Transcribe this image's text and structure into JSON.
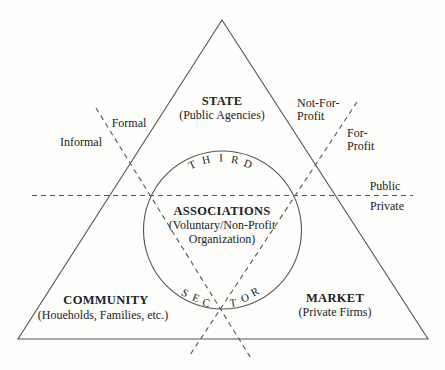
{
  "regions": {
    "state": {
      "label": "STATE",
      "sublabel": "(Public Agencies)"
    },
    "community": {
      "label": "COMMUNITY",
      "sublabel": "(Houeholds, Families, etc.)"
    },
    "market": {
      "label": "MARKET",
      "sublabel": "(Private Firms)"
    },
    "associations": {
      "label": "ASSOCIATIONS",
      "sublabel_line1": "(Voluntary/Non-Profit",
      "sublabel_line2": "Organization)"
    }
  },
  "dividers": {
    "formal": "Formal",
    "informal": "Informal",
    "not_for_profit_line1": "Not-For-",
    "not_for_profit_line2": "Profit",
    "for_profit_line1": "For-",
    "for_profit_line2": "Profit",
    "public": "Public",
    "private": "Private"
  },
  "circle_text": {
    "third": [
      "T",
      "H",
      "I",
      "R",
      "D"
    ],
    "sector": [
      "S",
      "E",
      "C",
      "T",
      "O",
      "R"
    ]
  },
  "colors": {
    "line": "#555555",
    "text": "#222222",
    "background": "#fdfdfb"
  }
}
